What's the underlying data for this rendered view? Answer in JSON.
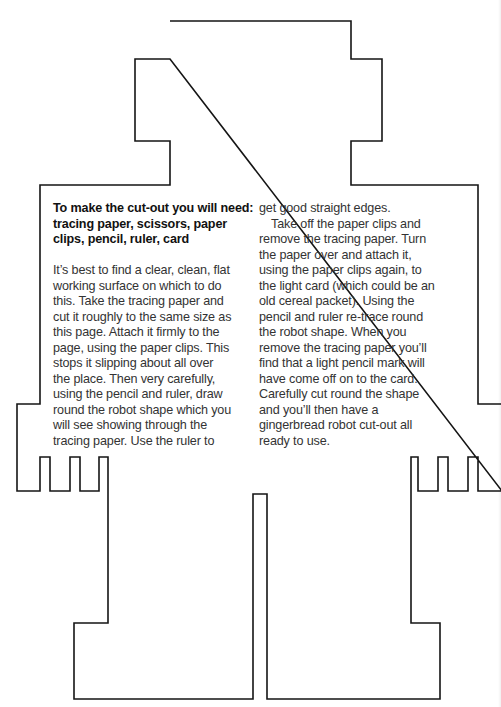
{
  "shape": {
    "name": "gingerbread robot cut-out outline",
    "stroke_color": "#111111",
    "background": "#ffffff"
  },
  "instructions": {
    "heading_lines": [
      "To make the cut-out you will need:",
      "tracing paper, scissors, paper",
      "clips, pencil, ruler, card"
    ],
    "left_column_lines": [
      "It’s best to find a clear, clean, flat",
      "working surface on which to do",
      "this. Take the tracing paper and",
      "cut it roughly to the same size as",
      "this page. Attach it firmly to the",
      "page, using the paper clips. This",
      "stops it slipping about all over",
      "the place. Then very carefully,",
      "using the pencil and ruler, draw",
      "round the robot shape which you",
      "will see showing through the",
      "tracing paper. Use the ruler to"
    ],
    "right_column_lines": [
      "get good straight edges.",
      "Take off the paper clips and",
      "remove the tracing paper. Turn",
      "the paper over and attach it,",
      "using the paper clips again, to",
      "the light card (which could be an",
      "old cereal packet). Using the",
      "pencil and ruler re-trace round",
      "the robot shape. When you",
      "remove the tracing paper you’ll",
      "find that a light pencil mark will",
      "have come off on to the card.",
      "Carefully cut round the shape",
      "and you’ll then have a",
      "gingerbread robot cut-out all",
      "ready to use."
    ]
  }
}
